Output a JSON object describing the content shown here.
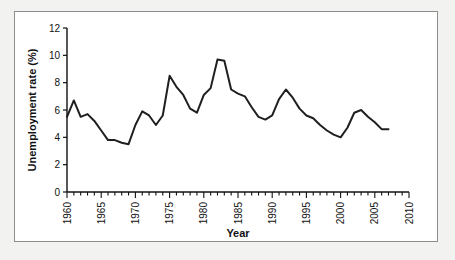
{
  "figure": {
    "background_color": "#f2f2f0",
    "panel_color": "#ffffff",
    "border_color": "#8d8d8d",
    "line_color": "#1f1f1f",
    "axis_color": "#111111"
  },
  "axis": {
    "y_title": "Unemployment rate (%)",
    "x_title": "Year",
    "y_ticks": [
      "0",
      "2",
      "4",
      "6",
      "8",
      "10",
      "12"
    ],
    "x_ticks": [
      "1960",
      "1965",
      "1970",
      "1975",
      "1980",
      "1985",
      "1990",
      "1995",
      "2000",
      "2005",
      "2010"
    ]
  },
  "source_note": {
    "text": ""
  },
  "chart_data": {
    "type": "line",
    "title": "",
    "subtitle": "",
    "xlabel": "Year",
    "ylabel": "Unemployment rate (%)",
    "xlim": [
      1960,
      2010
    ],
    "ylim": [
      0,
      12
    ],
    "xtick_step": 5,
    "ytick_step": 2,
    "grid": false,
    "legend": false,
    "legend_position": "none",
    "minor_xticks_step": 1,
    "series": [
      {
        "name": "Unemployment rate",
        "color": "#1f1f1f",
        "x": [
          1960,
          1961,
          1962,
          1963,
          1964,
          1965,
          1966,
          1967,
          1968,
          1969,
          1970,
          1971,
          1972,
          1973,
          1974,
          1975,
          1976,
          1977,
          1978,
          1979,
          1980,
          1981,
          1982,
          1983,
          1984,
          1985,
          1986,
          1987,
          1988,
          1989,
          1990,
          1991,
          1992,
          1993,
          1994,
          1995,
          1996,
          1997,
          1998,
          1999,
          2000,
          2001,
          2002,
          2003,
          2004,
          2005,
          2006,
          2007
        ],
        "values": [
          5.5,
          6.7,
          5.5,
          5.7,
          5.2,
          4.5,
          3.8,
          3.8,
          3.6,
          3.5,
          4.9,
          5.9,
          5.6,
          4.9,
          5.6,
          8.5,
          7.7,
          7.1,
          6.1,
          5.8,
          7.1,
          7.6,
          9.7,
          9.6,
          7.5,
          7.2,
          7.0,
          6.2,
          5.5,
          5.3,
          5.6,
          6.8,
          7.5,
          6.9,
          6.1,
          5.6,
          5.4,
          4.9,
          4.5,
          4.2,
          4.0,
          4.7,
          5.8,
          6.0,
          5.5,
          5.1,
          4.6,
          4.6
        ]
      }
    ]
  }
}
